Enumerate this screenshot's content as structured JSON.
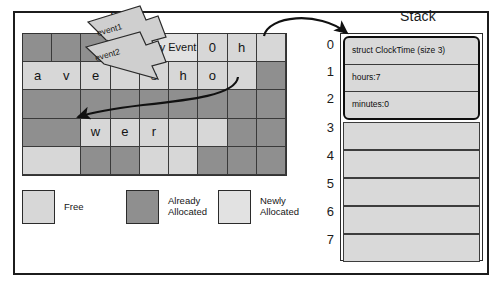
{
  "figure": {
    "heap_title": "Heap",
    "stack_title": "Stack"
  },
  "heap": {
    "columns": 9,
    "rows": 5,
    "cells": [
      [
        {
          "state": "alloc",
          "text": ""
        },
        {
          "state": "alloc",
          "text": ""
        },
        {
          "state": "alloc",
          "text": ""
        },
        {
          "state": "alloc",
          "text": ""
        },
        {
          "state": "newalloc",
          "text": "Daily Event",
          "span": 2
        },
        {
          "state": "free",
          "text": "0"
        },
        {
          "state": "free",
          "text": "h"
        },
        {
          "state": "free",
          "text": ""
        }
      ],
      [
        {
          "state": "free",
          "text": "a"
        },
        {
          "state": "free",
          "text": "v"
        },
        {
          "state": "free",
          "text": "e"
        },
        {
          "state": "free",
          "text": ""
        },
        {
          "state": "free",
          "text": "s"
        },
        {
          "state": "free",
          "text": "h"
        },
        {
          "state": "free",
          "text": "o"
        },
        {
          "state": "free",
          "text": ""
        },
        {
          "state": "alloc",
          "text": ""
        }
      ],
      [
        {
          "state": "alloc",
          "text": ""
        },
        {
          "state": "alloc",
          "text": ""
        },
        {
          "state": "alloc",
          "text": ""
        },
        {
          "state": "alloc",
          "text": ""
        },
        {
          "state": "alloc",
          "text": ""
        },
        {
          "state": "alloc",
          "text": ""
        },
        {
          "state": "alloc",
          "text": ""
        },
        {
          "state": "alloc",
          "text": ""
        },
        {
          "state": "alloc",
          "text": ""
        }
      ],
      [
        {
          "state": "alloc",
          "text": ""
        },
        {
          "state": "alloc",
          "text": ""
        },
        {
          "state": "free",
          "text": "w"
        },
        {
          "state": "free",
          "text": "e"
        },
        {
          "state": "free",
          "text": "r"
        },
        {
          "state": "free",
          "text": ""
        },
        {
          "state": "free",
          "text": ""
        },
        {
          "state": "alloc",
          "text": ""
        },
        {
          "state": "alloc",
          "text": ""
        }
      ],
      [
        {
          "state": "free",
          "text": ""
        },
        {
          "state": "free",
          "text": ""
        },
        {
          "state": "alloc",
          "text": ""
        },
        {
          "state": "alloc",
          "text": ""
        },
        {
          "state": "free",
          "text": ""
        },
        {
          "state": "free",
          "text": ""
        },
        {
          "state": "alloc",
          "text": ""
        },
        {
          "state": "alloc",
          "text": ""
        },
        {
          "state": "alloc",
          "text": ""
        }
      ]
    ]
  },
  "callouts": [
    {
      "label": "event1"
    },
    {
      "label": "event2"
    }
  ],
  "legend": [
    {
      "key": "free",
      "label": "Free",
      "color": "#d7d7d7"
    },
    {
      "key": "already",
      "label": "Already\nAllocated",
      "color": "#8f8f8f"
    },
    {
      "key": "newly",
      "label": "Newly\nAllocated",
      "color": "#e2e2e2"
    }
  ],
  "stack": {
    "indices": [
      "0",
      "1",
      "2",
      "3",
      "4",
      "5",
      "6",
      "7"
    ],
    "struct": {
      "header": "struct ClockTime (size 3)",
      "fields": [
        {
          "name": "hours:",
          "value": "7"
        },
        {
          "name": "minutes:",
          "value": "0"
        }
      ]
    },
    "empty_slots": 5
  },
  "colors": {
    "free": "#d7d7d7",
    "already_allocated": "#8f8f8f",
    "newly_allocated": "#e2e2e2",
    "stack_slot": "#d9d9d9",
    "ink": "#1a1a1a"
  }
}
